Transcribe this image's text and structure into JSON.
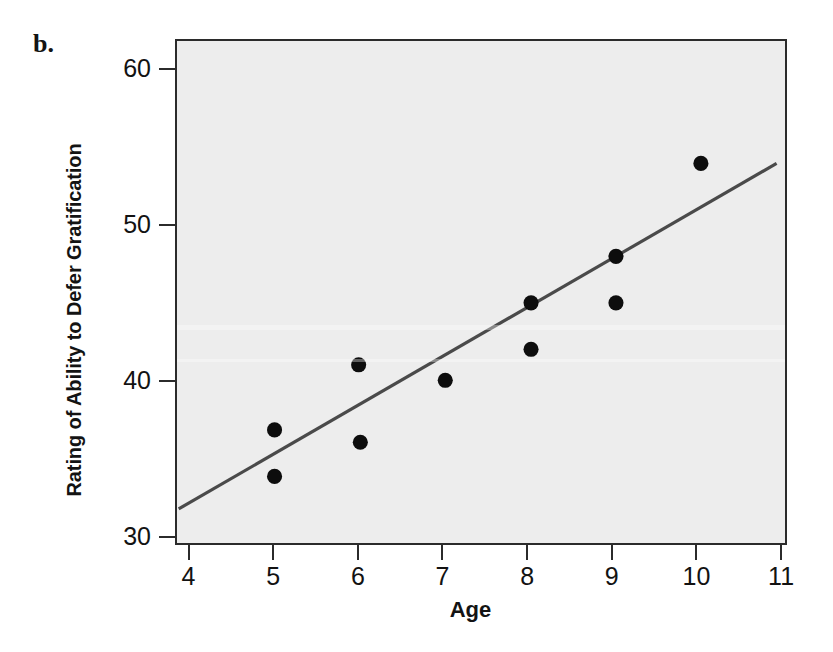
{
  "figure": {
    "panel_letter": "b.",
    "background_color": "#ffffff",
    "panel_background_color": "#ededed",
    "panel_border_color": "#2b2b2b",
    "marker_color": "#0d0d0d",
    "line_color": "#4a4a4a"
  },
  "chart_data": {
    "type": "scatter",
    "title": "",
    "xlabel": "Age",
    "ylabel": "Rating of Ability to Defer Gratification",
    "xlim": [
      3.84,
      11.07
    ],
    "ylim": [
      29.5,
      61.9
    ],
    "xticks": [
      4,
      5,
      6,
      7,
      8,
      9,
      10,
      11
    ],
    "xtick_labels": [
      "4",
      "5",
      "6",
      "7",
      "8",
      "9",
      "10",
      "11"
    ],
    "yticks": [
      30,
      40,
      50,
      60
    ],
    "ytick_labels": [
      "30",
      "40",
      "50",
      "60"
    ],
    "grid": false,
    "legend": null,
    "x": [
      5.0,
      5.0,
      6.0,
      6.02,
      7.03,
      8.05,
      8.05,
      9.06,
      9.06,
      10.07
    ],
    "y": [
      36.8,
      33.8,
      41.0,
      36.0,
      40.0,
      45.0,
      42.0,
      48.0,
      45.0,
      54.0
    ],
    "points": [
      {
        "age": 5.0,
        "rating": 36.8
      },
      {
        "age": 5.0,
        "rating": 33.8
      },
      {
        "age": 6.0,
        "rating": 41.0
      },
      {
        "age": 6.02,
        "rating": 36.0
      },
      {
        "age": 7.03,
        "rating": 40.0
      },
      {
        "age": 8.05,
        "rating": 45.0
      },
      {
        "age": 8.05,
        "rating": 42.0
      },
      {
        "age": 9.06,
        "rating": 48.0
      },
      {
        "age": 9.06,
        "rating": 45.0
      },
      {
        "age": 10.07,
        "rating": 54.0
      }
    ],
    "trendline": {
      "type": "linear-fit",
      "x_start": 3.86,
      "y_start": 31.7,
      "x_end": 10.97,
      "y_end": 54.0
    }
  }
}
